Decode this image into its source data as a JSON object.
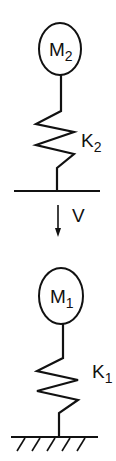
{
  "diagram": {
    "upper": {
      "mass_label": "M",
      "mass_subscript": "2",
      "spring_label": "K",
      "spring_subscript": "2"
    },
    "velocity": {
      "label": "V",
      "direction": "down"
    },
    "lower": {
      "mass_label": "M",
      "mass_subscript": "1",
      "spring_label": "K",
      "spring_subscript": "1"
    },
    "colors": {
      "stroke": "#111111",
      "background": "#ffffff"
    }
  }
}
